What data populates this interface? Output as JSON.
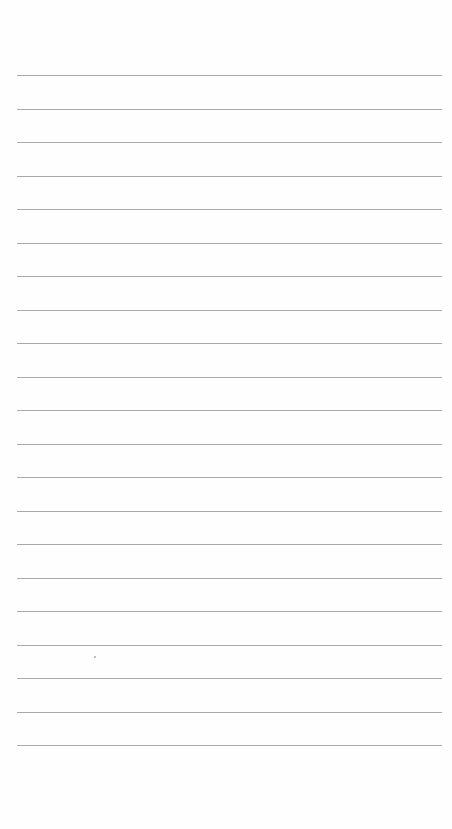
{
  "page": {
    "type": "lined-paper",
    "rule_count": 21,
    "rule_color": "#9a9a9a",
    "background_color": "#fefefe"
  }
}
